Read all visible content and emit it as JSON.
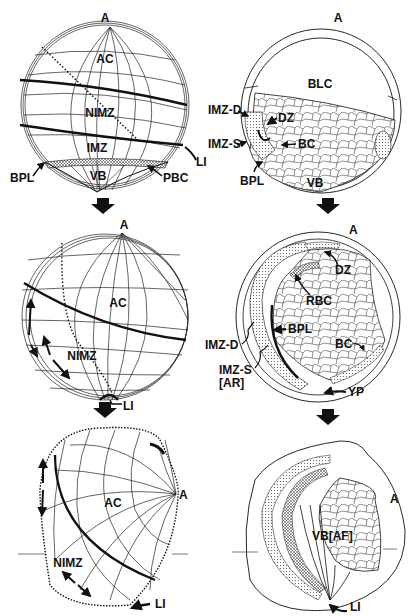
{
  "figure": {
    "panels": [
      {
        "id": "left-1",
        "view": "surface",
        "labels": {
          "animal_pole": "A",
          "animal_cap": "AC",
          "nimz": "NIMZ",
          "imz": "IMZ",
          "vegetal_base": "VB",
          "bpl": "BPL",
          "pbc": "PBC",
          "li": "LI"
        }
      },
      {
        "id": "right-1",
        "view": "section",
        "labels": {
          "animal_pole": "A",
          "blastocoel": "BLC",
          "imz_d": "IMZ-D",
          "imz_s": "IMZ-S",
          "dz": "DZ",
          "bc": "BC",
          "bpl": "BPL",
          "vb": "VB"
        }
      },
      {
        "id": "left-2",
        "view": "surface",
        "labels": {
          "animal_pole": "A",
          "animal_cap": "AC",
          "nimz": "NIMZ",
          "li": "LI"
        }
      },
      {
        "id": "right-2",
        "view": "section",
        "labels": {
          "animal_pole": "A",
          "dz": "DZ",
          "rbc": "RBC",
          "bpl": "BPL",
          "imz_d": "IMZ-D",
          "imz_s": "IMZ-S",
          "ar": "[AR]",
          "bc": "BC",
          "yp": "YP"
        }
      },
      {
        "id": "left-3",
        "view": "surface",
        "labels": {
          "animal_pole": "A",
          "animal_cap": "AC",
          "nimz": "NIMZ",
          "li": "LI"
        }
      },
      {
        "id": "right-3",
        "view": "section",
        "labels": {
          "animal_pole": "A",
          "vb_af": "VB[AF]",
          "li": "LI"
        }
      }
    ],
    "colors": {
      "ink": "#111111",
      "paper": "#ffffff",
      "stipple": "#9a9a9a"
    }
  }
}
